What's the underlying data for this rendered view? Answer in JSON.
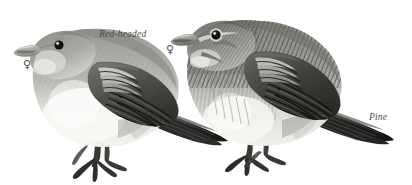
{
  "plate": {
    "kind": "bird-identification-plate",
    "style": "grayscale-field-guide-illustration",
    "background_color": "#ffffff",
    "ink_color": "#3a3a3a",
    "label_color": "#4a4a4a",
    "width": 412,
    "height": 185
  },
  "birds": [
    {
      "id": "red-headed",
      "label": "Red-headed",
      "sex_symbol": "♀",
      "sex_name": "female",
      "position": "left",
      "facing": "left",
      "plumage": "plain grey-brown head and back, pale unstreaked whitish underparts, dark wing with pale wingbars, pale conical bill, dark eye, long dark notched tail"
    },
    {
      "id": "pine",
      "label": "Pine",
      "sex_symbol": "♀",
      "sex_name": "female",
      "position": "right",
      "facing": "left",
      "plumage": "heavily streaked brown head breast and flanks, bold dark mantle streaking, pale eye-ring and moustachial stripe, dark notched tail"
    }
  ],
  "labels": {
    "red_headed": "Red-headed",
    "pine": "Pine",
    "female_symbol": "♀"
  }
}
